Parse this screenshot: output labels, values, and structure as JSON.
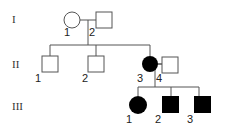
{
  "diagram": {
    "type": "pedigree",
    "generations": [
      {
        "label": "I",
        "members": [
          {
            "id": "I-1",
            "number": "1",
            "sex": "female",
            "affected": false
          },
          {
            "id": "I-2",
            "number": "2",
            "sex": "male",
            "affected": false
          }
        ]
      },
      {
        "label": "II",
        "members": [
          {
            "id": "II-1",
            "number": "1",
            "sex": "male",
            "affected": false
          },
          {
            "id": "II-2",
            "number": "2",
            "sex": "male",
            "affected": false
          },
          {
            "id": "II-3",
            "number": "3",
            "sex": "female",
            "affected": true
          },
          {
            "id": "II-4",
            "number": "4",
            "sex": "male",
            "affected": false
          }
        ]
      },
      {
        "label": "III",
        "members": [
          {
            "id": "III-1",
            "number": "1",
            "sex": "female",
            "affected": true
          },
          {
            "id": "III-2",
            "number": "2",
            "sex": "male",
            "affected": true
          },
          {
            "id": "III-3",
            "number": "3",
            "sex": "male",
            "affected": true
          }
        ]
      }
    ],
    "colors": {
      "affected": "#000000",
      "unaffected": "#ffffff",
      "line": "#555555"
    }
  },
  "labels": {
    "gen1": "I",
    "gen2": "II",
    "gen3": "III",
    "i1": "1",
    "i2": "2",
    "ii1": "1",
    "ii2": "2",
    "ii3": "3",
    "ii4": "4",
    "iii1": "1",
    "iii2": "2",
    "iii3": "3"
  }
}
